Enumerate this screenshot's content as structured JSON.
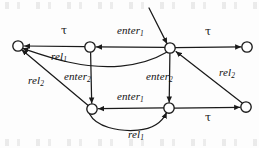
{
  "figure": {
    "kind": "automaton-transition-diagram",
    "stroke_color": "#1a1a1a",
    "node_fill": "#ffffff",
    "background": "#fdfdfd"
  },
  "nodes": [
    {
      "id": "s0",
      "name": "state-left",
      "cx": 18,
      "cy": 46,
      "r": 5.2
    },
    {
      "id": "s1",
      "name": "state-top-mid-left",
      "cx": 90,
      "cy": 47,
      "r": 5.2
    },
    {
      "id": "s2",
      "name": "state-top-center",
      "cx": 170,
      "cy": 48,
      "r": 5.2
    },
    {
      "id": "s3",
      "name": "state-top-right",
      "cx": 247,
      "cy": 47,
      "r": 5.2
    },
    {
      "id": "s4",
      "name": "state-bottom-left",
      "cx": 92,
      "cy": 109,
      "r": 5.2
    },
    {
      "id": "s5",
      "name": "state-bottom-center",
      "cx": 169,
      "cy": 108,
      "r": 5.2
    },
    {
      "id": "s6",
      "name": "state-bottom-right",
      "cx": 246,
      "cy": 107,
      "r": 5.2
    }
  ],
  "labels": [
    {
      "name": "label-tau-top-left",
      "text": "τ",
      "sub": "",
      "x": 61,
      "y": 26,
      "kind": "tau"
    },
    {
      "name": "label-enter1-top",
      "text": "enter",
      "sub": "1",
      "x": 117,
      "y": 26,
      "kind": "italic"
    },
    {
      "name": "label-tau-top-right",
      "text": "τ",
      "sub": "",
      "x": 204,
      "y": 27,
      "kind": "tau"
    },
    {
      "name": "label-rel1-upper",
      "text": "rel",
      "sub": "1",
      "x": 51,
      "y": 52,
      "kind": "italic"
    },
    {
      "name": "label-rel2-right",
      "text": "rel",
      "sub": "2",
      "x": 219,
      "y": 68,
      "kind": "italic"
    },
    {
      "name": "label-enter2-left",
      "text": "enter",
      "sub": "2",
      "x": 64,
      "y": 72,
      "kind": "italic"
    },
    {
      "name": "label-enter2-center",
      "text": "enter",
      "sub": "2",
      "x": 148,
      "y": 72,
      "kind": "italic"
    },
    {
      "name": "label-rel2-left",
      "text": "rel",
      "sub": "2",
      "x": 28,
      "y": 76,
      "kind": "italic"
    },
    {
      "name": "label-enter1-bottom",
      "text": "enter",
      "sub": "1",
      "x": 117,
      "y": 92,
      "kind": "italic"
    },
    {
      "name": "label-tau-bottom",
      "text": "τ",
      "sub": "",
      "x": 205,
      "y": 113,
      "kind": "tau"
    },
    {
      "name": "label-rel1-lower",
      "text": "rel",
      "sub": "1",
      "x": 128,
      "y": 130,
      "kind": "italic"
    }
  ],
  "edges": [
    {
      "name": "edge-initial-incoming",
      "from": "",
      "to": "s2",
      "label": "",
      "shape": "straight-diagonal"
    },
    {
      "name": "edge-s1-to-s0-tau",
      "from": "s1",
      "to": "s0",
      "label": "τ",
      "shape": "straight"
    },
    {
      "name": "edge-s2-to-s1-enter1",
      "from": "s2",
      "to": "s1",
      "label": "enter1",
      "shape": "straight"
    },
    {
      "name": "edge-s2-to-s3-tau",
      "from": "s2",
      "to": "s3",
      "label": "τ",
      "shape": "straight"
    },
    {
      "name": "edge-s2-to-s0-rel1",
      "from": "s2",
      "to": "s0",
      "label": "rel1",
      "shape": "curve"
    },
    {
      "name": "edge-s1-to-s4-enter2",
      "from": "s1",
      "to": "s4",
      "label": "enter2",
      "shape": "straight-vertical"
    },
    {
      "name": "edge-s2-to-s5-enter2",
      "from": "s2",
      "to": "s5",
      "label": "enter2",
      "shape": "straight-vertical"
    },
    {
      "name": "edge-s6-to-s2-rel2",
      "from": "s6",
      "to": "s2",
      "label": "rel2",
      "shape": "straight-diagonal"
    },
    {
      "name": "edge-s4-to-s0-rel2",
      "from": "s4",
      "to": "s0",
      "label": "rel2",
      "shape": "straight-diagonal"
    },
    {
      "name": "edge-s5-to-s4-enter1",
      "from": "s5",
      "to": "s4",
      "label": "enter1",
      "shape": "straight"
    },
    {
      "name": "edge-s5-to-s6-tau",
      "from": "s5",
      "to": "s6",
      "label": "τ",
      "shape": "straight"
    },
    {
      "name": "edge-s4-to-s5-rel1",
      "from": "s4",
      "to": "s5",
      "label": "rel1",
      "shape": "curve"
    }
  ]
}
